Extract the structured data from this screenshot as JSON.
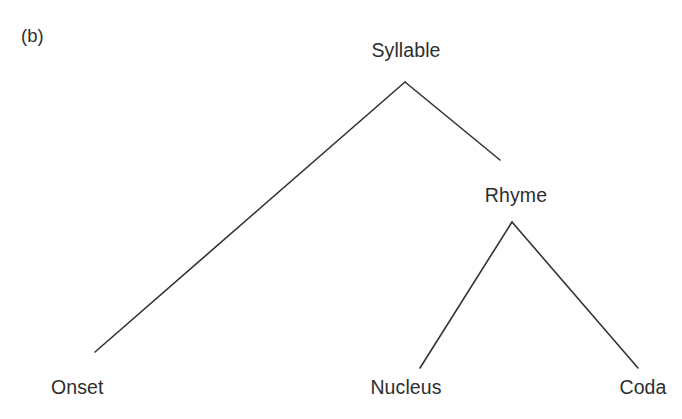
{
  "figure": {
    "panel_label": "(b)",
    "background_color": "#ffffff",
    "line_color": "#333333",
    "text_color": "#2e2e2e",
    "line_width": 1.6
  },
  "nodes": {
    "root": {
      "id": "syllable",
      "label": "Syllable",
      "x": 406,
      "y": 50,
      "apex_x": 405,
      "apex_y": 82,
      "level": 0
    },
    "rhyme": {
      "id": "rhyme",
      "label": "Rhyme",
      "x": 516,
      "y": 195,
      "apex_x": 512,
      "apex_y": 222,
      "level": 1
    },
    "onset": {
      "id": "onset",
      "label": "Onset",
      "x": 51,
      "y": 387,
      "attach_x": 95,
      "attach_y": 352,
      "level": 2
    },
    "nucleus": {
      "id": "nucleus",
      "label": "Nucleus",
      "x": 406,
      "y": 387,
      "attach_x": 420,
      "attach_y": 368,
      "level": 2
    },
    "coda": {
      "id": "coda",
      "label": "Coda",
      "x": 643,
      "y": 387,
      "attach_x": 638,
      "attach_y": 368,
      "level": 2
    }
  },
  "edges": [
    {
      "id": "syllable-to-onset",
      "from": "syllable",
      "to": "onset",
      "x1": 405,
      "y1": 82,
      "x2": 95,
      "y2": 352
    },
    {
      "id": "syllable-to-rhyme",
      "from": "syllable",
      "to": "rhyme",
      "x1": 405,
      "y1": 82,
      "x2": 500,
      "y2": 160
    },
    {
      "id": "rhyme-to-nucleus",
      "from": "rhyme",
      "to": "nucleus",
      "x1": 512,
      "y1": 222,
      "x2": 420,
      "y2": 368
    },
    {
      "id": "rhyme-to-coda",
      "from": "rhyme",
      "to": "coda",
      "x1": 512,
      "y1": 222,
      "x2": 638,
      "y2": 368
    }
  ]
}
